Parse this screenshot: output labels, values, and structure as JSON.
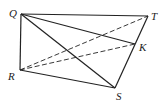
{
  "figure": {
    "type": "geometry-diagram",
    "stroke_color": "#222222",
    "points": {
      "Q": {
        "label": "Q",
        "x": 21,
        "y": 14,
        "lx": 9,
        "ly": 17
      },
      "T": {
        "label": "T",
        "x": 148,
        "y": 16,
        "lx": 151,
        "ly": 20
      },
      "K": {
        "label": "K",
        "x": 135,
        "y": 44,
        "lx": 139,
        "ly": 51
      },
      "R": {
        "label": "R",
        "x": 20,
        "y": 70,
        "lx": 8,
        "ly": 80
      },
      "S": {
        "label": "S",
        "x": 115,
        "y": 88,
        "lx": 116,
        "ly": 100
      }
    },
    "segments": [
      {
        "from": "Q",
        "to": "T",
        "style": "solid"
      },
      {
        "from": "Q",
        "to": "R",
        "style": "solid"
      },
      {
        "from": "Q",
        "to": "K",
        "style": "solid"
      },
      {
        "from": "Q",
        "to": "S",
        "style": "solid"
      },
      {
        "from": "R",
        "to": "S",
        "style": "solid"
      },
      {
        "from": "T",
        "to": "S",
        "style": "solid"
      },
      {
        "from": "R",
        "to": "T",
        "style": "dashed"
      },
      {
        "from": "R",
        "to": "K",
        "style": "dashed"
      }
    ]
  }
}
